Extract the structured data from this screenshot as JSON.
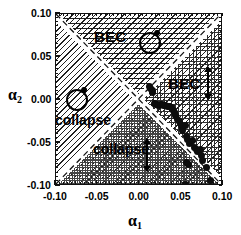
{
  "figure": {
    "kind": "phase-diagram",
    "background": "#ffffff",
    "ink": "#000000"
  },
  "axes": {
    "x": {
      "label": "α",
      "label_sub": "1",
      "ticks": [
        "-0.10",
        "-0.05",
        "0.00",
        "0.05",
        "0.10"
      ],
      "tick_values": [
        -0.1,
        -0.05,
        0.0,
        0.05,
        0.1
      ],
      "min": -0.1,
      "max": 0.1
    },
    "y": {
      "label": "α",
      "label_sub": "2",
      "ticks": [
        "0.10",
        "0.05",
        "0.00",
        "-0.05",
        "-0.10"
      ],
      "tick_values": [
        0.1,
        0.05,
        0.0,
        -0.05,
        -0.1
      ],
      "min": -0.1,
      "max": 0.1
    }
  },
  "regions": [
    {
      "name": "bec-top",
      "label": "BEC",
      "pattern": "horizontal-lines"
    },
    {
      "name": "bec-right",
      "label": "BEC",
      "pattern": "cross-hatch-grid"
    },
    {
      "name": "collapse-left",
      "label": "collapse",
      "pattern": "diagonal-hatch"
    },
    {
      "name": "collapse-bottom",
      "label": "collapse",
      "pattern": "stipple-checker"
    }
  ],
  "annotations": {
    "bec_top_label": "BEC",
    "bec_right_label": "BEC",
    "collapse_left_label": "collapse",
    "collapse_bottom_label": "collapse",
    "circle_glyph_top": "circle-with-cusp-icon",
    "circle_glyph_left": "circle-with-cusp-icon",
    "arrow_right": "double-headed-vertical-arrow-icon",
    "arrow_bottom": "double-headed-vertical-arrow-icon"
  },
  "chart_data": {
    "type": "scatter",
    "title": "",
    "xlabel": "alpha_1",
    "ylabel": "alpha_2",
    "xlim": [
      -0.1,
      0.1
    ],
    "ylim": [
      -0.1,
      0.1
    ],
    "grid": false,
    "legend": null,
    "series": [
      {
        "name": "measured phase boundary",
        "marker": "filled-circle",
        "color": "#0d0d0d",
        "points": [
          [
            0.0125,
            0.0155
          ],
          [
            0.0135,
            0.013
          ],
          [
            0.015,
            0.011
          ],
          [
            0.016,
            0.009
          ],
          [
            0.0175,
            -0.004
          ],
          [
            0.019,
            -0.005
          ],
          [
            0.021,
            -0.0055
          ],
          [
            0.023,
            -0.006
          ],
          [
            0.025,
            -0.0058
          ],
          [
            0.027,
            -0.0055
          ],
          [
            0.029,
            -0.006
          ],
          [
            0.031,
            -0.0065
          ],
          [
            0.033,
            -0.007
          ],
          [
            0.0355,
            -0.0075
          ],
          [
            0.038,
            -0.0085
          ],
          [
            0.04,
            -0.011
          ],
          [
            0.0415,
            -0.015
          ],
          [
            0.043,
            -0.0185
          ],
          [
            0.045,
            -0.023
          ],
          [
            0.048,
            -0.0245
          ],
          [
            0.05,
            -0.03
          ],
          [
            0.052,
            -0.035
          ],
          [
            0.0545,
            -0.03
          ],
          [
            0.056,
            -0.042
          ],
          [
            0.058,
            -0.046
          ],
          [
            0.06,
            -0.05
          ],
          [
            0.063,
            -0.047
          ],
          [
            0.0655,
            -0.0555
          ],
          [
            0.068,
            -0.058
          ],
          [
            0.07,
            -0.06
          ],
          [
            0.0725,
            -0.0575
          ],
          [
            0.0745,
            -0.064
          ],
          [
            0.056,
            -0.073
          ],
          [
            0.0585,
            -0.0755
          ],
          [
            0.076,
            -0.07
          ],
          [
            0.08,
            -0.079
          ],
          [
            0.0545,
            -0.0985
          ],
          [
            0.085,
            -0.094
          ]
        ]
      }
    ],
    "boundary_lines": [
      {
        "name": "diagonal-up",
        "style": "dashed",
        "from": [
          -0.1,
          -0.1
        ],
        "to": [
          0.1,
          0.1
        ]
      },
      {
        "name": "diagonal-down",
        "style": "dashed",
        "from": [
          -0.1,
          0.1
        ],
        "to": [
          0.1,
          -0.1
        ]
      }
    ]
  }
}
